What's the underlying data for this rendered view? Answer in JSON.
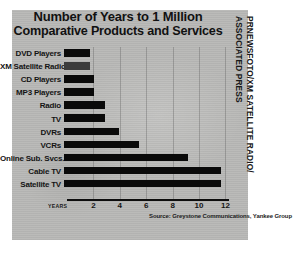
{
  "chart_data": {
    "type": "bar",
    "orientation": "horizontal",
    "title": "Number of Years to 1 Million Comparative Products and Services",
    "title_lines": [
      "Number of Years to 1 Million",
      "Comparative Products and Services"
    ],
    "categories": [
      "DVD Players",
      "XM Satellite Radio",
      "CD Players",
      "MP3 Players",
      "Radio",
      "TV",
      "DVRs",
      "VCRs",
      "Online Sub. Svcs.",
      "Cable TV",
      "Satellite TV"
    ],
    "values": [
      2.0,
      2.0,
      2.3,
      2.3,
      3.1,
      3.1,
      4.2,
      5.7,
      9.4,
      11.9,
      11.9
    ],
    "highlight_category": "XM Satellite Radio",
    "xlabel": "YEARS",
    "ylabel": "",
    "xlim": [
      0,
      12.8
    ],
    "xticks": [
      2,
      4,
      6,
      8,
      10,
      12
    ],
    "xtick_labels": [
      "2",
      "4",
      "6",
      "8",
      "10",
      "12"
    ],
    "grid": true,
    "legend": false,
    "source": "Source: Greystone Communications, Yankee Group",
    "colors": {
      "bar": "#0a0a0a",
      "bar_highlight": "#3c3c3c",
      "panel_background": "#b9b9b7",
      "text": "#141414",
      "axis": "#0d0d0d"
    }
  },
  "credit": {
    "lines": [
      "PRNEWSFOTO/XM SATELLITE RADIO/",
      "ASSOCIATED PRESS"
    ]
  }
}
